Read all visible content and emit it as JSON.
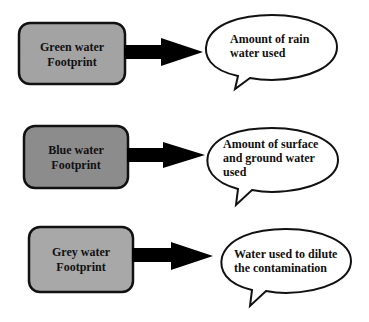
{
  "diagram": {
    "rows": [
      {
        "source": {
          "line1": "Green water",
          "line2": "Footprint",
          "fill": "#a3a3a3"
        },
        "description": {
          "line1": "Amount of rain",
          "line2": "water used",
          "line3": ""
        }
      },
      {
        "source": {
          "line1": "Blue water",
          "line2": "Footprint",
          "fill": "#8c8c8c"
        },
        "description": {
          "line1": "Amount of surface",
          "line2": "and ground water",
          "line3": "used"
        }
      },
      {
        "source": {
          "line1": "Grey water",
          "line2": "Footprint",
          "fill": "#a8a8a8"
        },
        "description": {
          "line1": "Water used to dilute",
          "line2": "the contamination",
          "line3": ""
        }
      }
    ]
  }
}
